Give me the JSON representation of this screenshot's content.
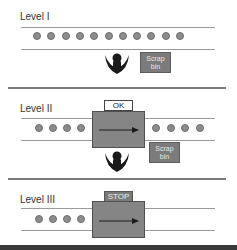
{
  "levels": [
    {
      "label": "Level I",
      "balls_count": 11,
      "scrap_bin": {
        "line1": "Scrap",
        "line2": "bin"
      },
      "has_operator": true
    },
    {
      "label": "Level II",
      "balls_left": 4,
      "balls_right": 4,
      "machine_tag": "OK",
      "scrap_bin": {
        "line1": "Scrap",
        "line2": "bin"
      },
      "has_operator": true
    },
    {
      "label": "Level III",
      "balls_left": 4,
      "balls_right": 0,
      "machine_tag": "STOP",
      "has_operator": false
    }
  ],
  "colors": {
    "ball": "#8c8c8c",
    "machine": "#858585",
    "scrap_bin": "#7b7b7b",
    "operator": "#1a1a1a",
    "stop_tag": "#7a7a7a"
  }
}
